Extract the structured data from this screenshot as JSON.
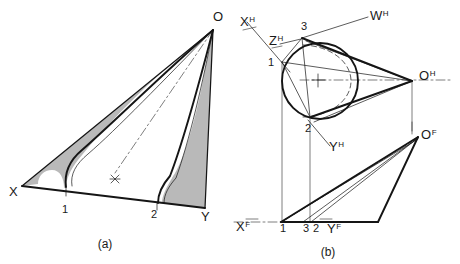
{
  "figure": {
    "panels": [
      {
        "id": "a",
        "caption": "(a)",
        "caption_x": 105,
        "caption_y": 248,
        "description": "Pictorial view of oblique cone with shaded developable lobes",
        "labels": [
          {
            "name": "vertex-o",
            "text": "O",
            "x": 213,
            "y": 21,
            "cls": "lbl-main"
          },
          {
            "name": "vertex-x",
            "text": "X",
            "x": 9,
            "y": 196,
            "cls": "lbl-main"
          },
          {
            "name": "point-1",
            "text": "1",
            "x": 62,
            "y": 213,
            "cls": "lbl-num"
          },
          {
            "name": "point-2",
            "text": "2",
            "x": 151,
            "y": 218,
            "cls": "lbl-num"
          },
          {
            "name": "vertex-y",
            "text": "Y",
            "x": 201,
            "y": 221,
            "cls": "lbl-main"
          }
        ]
      },
      {
        "id": "b",
        "caption": "(b)",
        "caption_x": 328,
        "caption_y": 256,
        "description": "Top (H) and front (F) orthographic projections of the same cone",
        "labels": [
          {
            "name": "axis-x-h",
            "text": "X",
            "sup": "H",
            "x": 240,
            "y": 26,
            "cls": "lbl-main"
          },
          {
            "name": "axis-z-h",
            "text": "Z",
            "sup": "H",
            "x": 269,
            "y": 45,
            "cls": "lbl-main"
          },
          {
            "name": "axis-w-h",
            "text": "W",
            "sup": "H",
            "x": 370,
            "y": 20,
            "cls": "lbl-main"
          },
          {
            "name": "axis-y-h",
            "text": "Y",
            "sup": "H",
            "x": 329,
            "y": 151,
            "cls": "lbl-main"
          },
          {
            "name": "vertex-o-h",
            "text": "O",
            "sup": "H",
            "x": 419,
            "y": 80,
            "cls": "lbl-main"
          },
          {
            "name": "point-3-h",
            "text": "3",
            "x": 301,
            "y": 30,
            "cls": "lbl-num"
          },
          {
            "name": "point-1-h",
            "text": "1",
            "x": 268,
            "y": 66,
            "cls": "lbl-num"
          },
          {
            "name": "point-2-h",
            "text": "2",
            "x": 305,
            "y": 132,
            "cls": "lbl-num"
          },
          {
            "name": "axis-x-f",
            "text": "X",
            "sup": "F",
            "x": 236,
            "y": 231,
            "cls": "lbl-main"
          },
          {
            "name": "point-1-f",
            "text": "1",
            "x": 280,
            "y": 232,
            "cls": "lbl-num"
          },
          {
            "name": "point-3-f",
            "text": "3",
            "x": 303,
            "y": 232,
            "cls": "lbl-num"
          },
          {
            "name": "point-2-f",
            "text": "2",
            "x": 313,
            "y": 232,
            "cls": "lbl-num"
          },
          {
            "name": "axis-y-f",
            "text": "Y",
            "sup": "F",
            "x": 327,
            "y": 233,
            "cls": "lbl-main"
          },
          {
            "name": "vertex-o-f",
            "text": "O",
            "sup": "F",
            "x": 421,
            "y": 139,
            "cls": "lbl-main"
          }
        ]
      }
    ],
    "colors": {
      "ink": "#151515",
      "shade": "#b9b9b9",
      "background": "#ffffff"
    }
  }
}
